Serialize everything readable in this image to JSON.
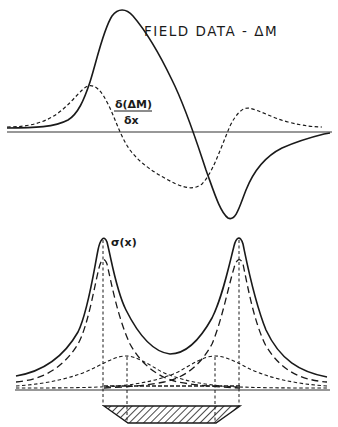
{
  "top_panel": {
    "title_label": "FIELD DATA - ΔM",
    "derivative_label": {
      "numerator": "δ(ΔM)",
      "denominator": "δx"
    },
    "curves": [
      {
        "name": "field-data-delta-m",
        "style": "solid"
      },
      {
        "name": "horizontal-derivative",
        "style": "short-dashed"
      }
    ]
  },
  "bottom_panel": {
    "sigma_label": "σ(x)",
    "curves": [
      {
        "name": "total-sigma",
        "style": "solid"
      },
      {
        "name": "edge-contributions",
        "style": "long-dashed"
      },
      {
        "name": "inner-contributions",
        "style": "short-dashed"
      }
    ],
    "body": {
      "name": "hatched-source-body",
      "fill": "diagonal-hatch"
    }
  },
  "colors": {
    "ink": "#1a1a1a",
    "background": "#ffffff"
  }
}
